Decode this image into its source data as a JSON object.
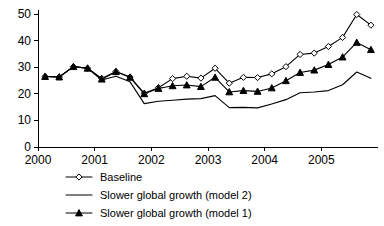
{
  "chart_data": {
    "type": "line",
    "title": "",
    "xlabel": "",
    "ylabel": "",
    "xlim": [
      2000.0,
      2006.0
    ],
    "ylim": [
      0,
      50
    ],
    "yticks": [
      0,
      10,
      20,
      30,
      40,
      50
    ],
    "xticks": [
      2000,
      2001,
      2002,
      2003,
      2004,
      2005
    ],
    "xtick_labels": [
      "2000",
      "2001",
      "2002",
      "2003",
      "2004",
      "2005"
    ],
    "ytick_labels": [
      "0",
      "10",
      "20",
      "30",
      "40",
      "50"
    ],
    "grid": false,
    "legend_position": "below",
    "x": [
      2000.125,
      2000.375,
      2000.625,
      2000.875,
      2001.125,
      2001.375,
      2001.625,
      2001.875,
      2002.125,
      2002.375,
      2002.625,
      2002.875,
      2003.125,
      2003.375,
      2003.625,
      2003.875,
      2004.125,
      2004.375,
      2004.625,
      2004.875,
      2005.125,
      2005.375,
      2005.625,
      2005.875
    ],
    "series": [
      {
        "name": "Baseline",
        "marker": "open-diamond",
        "values": [
          26.5,
          26.3,
          30.2,
          29.6,
          25.8,
          28.4,
          26.3,
          20.2,
          22.3,
          25.7,
          26.6,
          25.9,
          29.6,
          24.0,
          26.2,
          26.1,
          27.5,
          30.2,
          34.8,
          35.3,
          37.8,
          41.2,
          49.8,
          45.8
        ]
      },
      {
        "name": "Slower global growth (model 2)",
        "marker": "none",
        "values": [
          26.5,
          26.3,
          30.2,
          29.6,
          25.2,
          26.6,
          24.5,
          16.3,
          17.2,
          17.6,
          18.0,
          18.2,
          19.3,
          14.8,
          14.9,
          14.7,
          16.2,
          17.8,
          20.4,
          20.7,
          21.2,
          23.4,
          28.2,
          25.8
        ]
      },
      {
        "name": "Slower global growth (model 1)",
        "marker": "filled-triangle",
        "values": [
          26.5,
          26.3,
          30.2,
          29.6,
          25.5,
          28.3,
          26.2,
          20.0,
          22.0,
          23.0,
          23.3,
          22.7,
          26.2,
          20.7,
          21.2,
          20.9,
          22.2,
          24.9,
          28.0,
          28.9,
          31.0,
          33.8,
          39.3,
          36.6
        ]
      }
    ]
  },
  "legend": {
    "items": [
      {
        "label": "Baseline",
        "marker": "open-diamond"
      },
      {
        "label": "Slower global growth (model 2)",
        "marker": "none"
      },
      {
        "label": "Slower global growth (model 1)",
        "marker": "filled-triangle"
      }
    ]
  }
}
